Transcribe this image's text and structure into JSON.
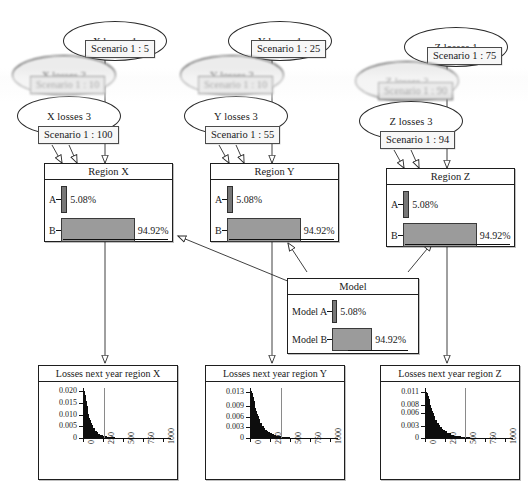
{
  "diagram": {
    "columns": [
      {
        "key": "x",
        "scenario_nodes": [
          {
            "ellipse": "X losses 1",
            "tag": "Scenario 1 : 5",
            "blurry": false
          },
          {
            "ellipse": "X losses 2",
            "tag": "Scenario 1 : 10",
            "blurry": true
          },
          {
            "ellipse": "X losses 3",
            "tag": "Scenario 1 : 100",
            "blurry": false
          }
        ],
        "region": {
          "title": "Region X",
          "rows": [
            {
              "label": "A",
              "value": "5.08%",
              "pct": 5.08
            },
            {
              "label": "B",
              "value": "94.92%",
              "pct": 94.92
            }
          ]
        },
        "chart_title": "Losses next year region X"
      },
      {
        "key": "y",
        "scenario_nodes": [
          {
            "ellipse": "Y losses 1",
            "tag": "Scenario 1 : 25",
            "blurry": false
          },
          {
            "ellipse": "Y losses 2",
            "tag": "Scenario 1 : 10",
            "blurry": true
          },
          {
            "ellipse": "Y losses 3",
            "tag": "Scenario 1 : 55",
            "blurry": false
          }
        ],
        "region": {
          "title": "Region Y",
          "rows": [
            {
              "label": "A",
              "value": "5.08%",
              "pct": 5.08
            },
            {
              "label": "B",
              "value": "94.92%",
              "pct": 94.92
            }
          ]
        },
        "chart_title": "Losses next year region Y"
      },
      {
        "key": "z",
        "scenario_nodes": [
          {
            "ellipse": "Z losses 1",
            "tag": "Scenario 1 : 75",
            "blurry": false
          },
          {
            "ellipse": "Z losses 2",
            "tag": "Scenario 1 : 90",
            "blurry": true
          },
          {
            "ellipse": "Z losses 3",
            "tag": "Scenario 1 : 94",
            "blurry": false
          }
        ],
        "region": {
          "title": "Region Z",
          "rows": [
            {
              "label": "A",
              "value": "5.08%",
              "pct": 5.08
            },
            {
              "label": "B",
              "value": "94.92%",
              "pct": 94.92
            }
          ]
        },
        "chart_title": "Losses next year region Z"
      }
    ],
    "model": {
      "title": "Model",
      "rows": [
        {
          "label": "Model A",
          "value": "5.08%",
          "pct": 5.08
        },
        {
          "label": "Model B",
          "value": "94.92%",
          "pct": 94.92
        }
      ]
    }
  },
  "chart_data": [
    {
      "type": "area",
      "title": "Losses next year region X",
      "xlabel": "",
      "ylabel": "",
      "xlim": [
        0,
        1100
      ],
      "ylim": [
        0,
        0.0215
      ],
      "xticks": [
        0,
        250,
        500,
        750,
        1000
      ],
      "xtick_labels": [
        "0",
        "250",
        "500",
        "750",
        "1000"
      ],
      "yticks": [
        0,
        0.005,
        0.01,
        0.015,
        0.02
      ],
      "ytick_labels": [
        "0",
        "0.005",
        "0.010",
        "0.015",
        "0.020"
      ],
      "grid": false,
      "legend": "none",
      "reference_line_x": 265,
      "x": [
        5,
        15,
        25,
        35,
        45,
        55,
        65,
        75,
        85,
        95,
        110,
        130,
        150,
        170,
        190,
        210,
        230,
        250,
        275,
        300,
        330,
        360,
        400,
        450,
        500,
        560,
        620,
        700,
        800,
        900,
        1000,
        1080
      ],
      "values": [
        0.0135,
        0.0202,
        0.0185,
        0.016,
        0.0138,
        0.0119,
        0.0102,
        0.0088,
        0.0076,
        0.0066,
        0.0054,
        0.0041,
        0.0031,
        0.0024,
        0.0019,
        0.0015,
        0.0012,
        0.001,
        0.0007,
        0.0005,
        0.00035,
        0.00025,
        0.00016,
        0.0001,
        6e-05,
        4e-05,
        3e-05,
        2e-05,
        1e-05,
        1e-05,
        5e-06,
        3e-06
      ]
    },
    {
      "type": "area",
      "title": "Losses next year region Y",
      "xlabel": "",
      "ylabel": "",
      "xlim": [
        0,
        1100
      ],
      "ylim": [
        0,
        0.014
      ],
      "xticks": [
        0,
        250,
        500,
        750,
        1000
      ],
      "xtick_labels": [
        "0",
        "250",
        "500",
        "750",
        "1000"
      ],
      "yticks": [
        0,
        0.003,
        0.006,
        0.009,
        0.013
      ],
      "ytick_labels": [
        "0",
        "0.003",
        "0.006",
        "0.009",
        "0.013"
      ],
      "grid": false,
      "legend": "none",
      "reference_line_x": 390,
      "x": [
        5,
        15,
        25,
        35,
        45,
        55,
        65,
        75,
        85,
        95,
        110,
        130,
        150,
        170,
        190,
        210,
        230,
        250,
        275,
        300,
        330,
        360,
        400,
        450,
        500,
        560,
        620,
        700,
        800,
        900,
        1000,
        1080
      ],
      "values": [
        0.009,
        0.0131,
        0.0126,
        0.0115,
        0.0104,
        0.0094,
        0.0085,
        0.0076,
        0.0068,
        0.0061,
        0.0052,
        0.0042,
        0.0034,
        0.0028,
        0.0023,
        0.0019,
        0.0016,
        0.0013,
        0.001,
        0.0008,
        0.0006,
        0.00045,
        0.0003,
        0.0002,
        0.00013,
        8e-05,
        5e-05,
        3e-05,
        2e-05,
        1e-05,
        8e-06,
        5e-06
      ]
    },
    {
      "type": "area",
      "title": "Losses next year region Z",
      "xlabel": "",
      "ylabel": "",
      "xlim": [
        0,
        1100
      ],
      "ylim": [
        0,
        0.012
      ],
      "xticks": [
        0,
        250,
        500,
        750,
        1000
      ],
      "xtick_labels": [
        "0",
        "250",
        "500",
        "750",
        "1000"
      ],
      "yticks": [
        0,
        0.003,
        0.006,
        0.008,
        0.011
      ],
      "ytick_labels": [
        "0",
        "0.003",
        "0.006",
        "0.008",
        "0.011"
      ],
      "grid": false,
      "legend": "none",
      "reference_line_x": 500,
      "x": [
        5,
        15,
        25,
        35,
        45,
        55,
        65,
        75,
        85,
        95,
        110,
        130,
        150,
        170,
        190,
        210,
        230,
        250,
        275,
        300,
        330,
        360,
        400,
        450,
        500,
        560,
        620,
        700,
        800,
        900,
        1000,
        1080
      ],
      "values": [
        0.0075,
        0.0111,
        0.0108,
        0.0101,
        0.0093,
        0.0086,
        0.0079,
        0.0072,
        0.0066,
        0.006,
        0.0053,
        0.0044,
        0.0037,
        0.0031,
        0.0026,
        0.0022,
        0.0019,
        0.0016,
        0.0013,
        0.0011,
        0.0008,
        0.0006,
        0.00042,
        0.00028,
        0.00018,
        0.00011,
        7e-05,
        4e-05,
        2e-05,
        2e-05,
        1e-05,
        6e-06
      ]
    }
  ]
}
